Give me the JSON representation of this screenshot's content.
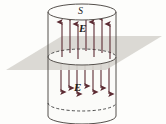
{
  "figure": {
    "labels": {
      "surface": "S",
      "field_top": "E",
      "field_bottom": "E"
    },
    "colors": {
      "background": "#fdfdfb",
      "plane_fill": "#d8d6d0",
      "cylinder_outline": "#55504c",
      "cylinder_fill": "#fbfbf9",
      "arrow": "#5c2b33",
      "cap_fill": "#f7f7f4"
    },
    "geometry": {
      "cylinder": {
        "left_x": 48,
        "right_x": 116,
        "top_y": 12,
        "bottom_y": 116,
        "ellipse_rx": 34,
        "ellipse_ry": 8
      },
      "plane": {
        "points": "6,70 62,36 162,36 106,70",
        "note": "light gray parallelogram representing the infinite sheet of charge seen edge-on in perspective"
      },
      "mid_disk_y": 57
    },
    "field": {
      "top_arrow_count": 7,
      "bottom_arrow_count": 7,
      "top_direction": "up",
      "bottom_direction": "down",
      "top_arrow_x": [
        62,
        70,
        78,
        86,
        94,
        102,
        110
      ],
      "top_arrow_y_tip": [
        22,
        18,
        24,
        16,
        22,
        18,
        24
      ],
      "top_arrow_y_tail": [
        57,
        53,
        59,
        51,
        57,
        53,
        59
      ],
      "bottom_arrow_x": [
        61,
        69,
        77,
        85,
        93,
        101,
        109
      ],
      "bottom_arrow_y_head": [
        63,
        61,
        63,
        61,
        63,
        61,
        63
      ],
      "bottom_arrow_y_tip": [
        92,
        88,
        94,
        86,
        92,
        88,
        94
      ]
    }
  }
}
